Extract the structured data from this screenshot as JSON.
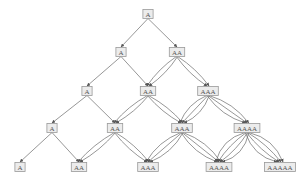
{
  "diagram": {
    "type": "multiway-graph",
    "rows": [
      {
        "y": 14,
        "nodes": [
          {
            "label": "A",
            "x": 148
          }
        ]
      },
      {
        "y": 52,
        "nodes": [
          {
            "label": "A",
            "x": 121
          },
          {
            "label": "AA",
            "x": 177
          }
        ]
      },
      {
        "y": 91,
        "nodes": [
          {
            "label": "A",
            "x": 87
          },
          {
            "label": "AA",
            "x": 148
          },
          {
            "label": "AAA",
            "x": 208
          }
        ]
      },
      {
        "y": 128,
        "nodes": [
          {
            "label": "A",
            "x": 52
          },
          {
            "label": "AA",
            "x": 115
          },
          {
            "label": "AAA",
            "x": 182
          },
          {
            "label": "AAAA",
            "x": 247
          }
        ]
      },
      {
        "y": 167,
        "nodes": [
          {
            "label": "A",
            "x": 20
          },
          {
            "label": "AA",
            "x": 79
          },
          {
            "label": "AAA",
            "x": 148
          },
          {
            "label": "AAAA",
            "x": 219
          },
          {
            "label": "AAAAA",
            "x": 280
          }
        ]
      }
    ],
    "edge_rule": "each node with label of length n has n edges to the same label in the next row and n edges to the label one longer",
    "colors": {
      "node_fill": "#ececec",
      "node_stroke": "#9a9a9a",
      "edge": "#6a6a6a",
      "text": "#555555"
    }
  }
}
